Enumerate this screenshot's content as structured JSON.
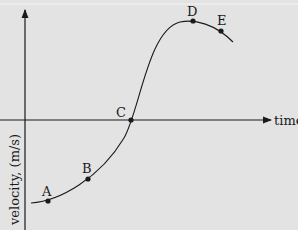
{
  "diagram": {
    "x_axis_label": "time",
    "y_axis_label": "velocity, (m/s)",
    "points": [
      {
        "label": "A",
        "x": 48,
        "y": 201,
        "lx": 42,
        "ly": 196
      },
      {
        "label": "B",
        "x": 88,
        "y": 179,
        "lx": 82,
        "ly": 173
      },
      {
        "label": "C",
        "x": 131,
        "y": 120,
        "lx": 116,
        "ly": 117
      },
      {
        "label": "D",
        "x": 193,
        "y": 21,
        "lx": 187,
        "ly": 16
      },
      {
        "label": "E",
        "x": 221,
        "y": 31,
        "lx": 217,
        "ly": 25
      }
    ],
    "colors": {
      "background": "#e3e3e3",
      "ink": "#1a1a1a"
    }
  }
}
